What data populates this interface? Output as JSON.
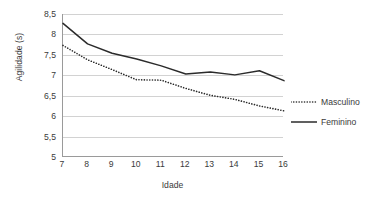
{
  "chart_data": {
    "type": "line",
    "title": "",
    "xlabel": "Idade",
    "ylabel": "Agilidade (s)",
    "x": [
      7,
      8,
      9,
      10,
      11,
      12,
      13,
      14,
      15,
      16
    ],
    "xtick_labels": [
      "7",
      "8",
      "9",
      "10",
      "11",
      "12",
      "13",
      "14",
      "15",
      "16"
    ],
    "ytick_labels": [
      "8,5",
      "8",
      "7,5",
      "7",
      "6,5",
      "6",
      "5,5",
      "5"
    ],
    "ytick_values": [
      8.5,
      8,
      7.5,
      7,
      6.5,
      6,
      5.5,
      5
    ],
    "ylim": [
      5,
      8.5
    ],
    "xlim": [
      7,
      16
    ],
    "grid": "horizontal",
    "legend_position": "right",
    "series": [
      {
        "name": "Masculino",
        "style": "dotted",
        "color": "#2b2b2b",
        "values": [
          7.73,
          7.38,
          7.14,
          6.89,
          6.88,
          6.68,
          6.51,
          6.41,
          6.25,
          6.13
        ]
      },
      {
        "name": "Feminino",
        "style": "solid",
        "color": "#2b2b2b",
        "values": [
          8.27,
          7.77,
          7.54,
          7.4,
          7.23,
          7.03,
          7.08,
          7.01,
          7.11,
          6.87
        ]
      }
    ]
  },
  "axes": {
    "y_title": "Agilidade (s)",
    "x_title": "Idade"
  },
  "legend": {
    "items": [
      {
        "label": "Masculino",
        "style": "dotted"
      },
      {
        "label": "Feminino",
        "style": "solid"
      }
    ]
  },
  "colors": {
    "line": "#2b2b2b",
    "grid": "#d2d2d2",
    "axis": "#9a9a9a",
    "text": "#3a3a3a",
    "background": "#ffffff"
  }
}
